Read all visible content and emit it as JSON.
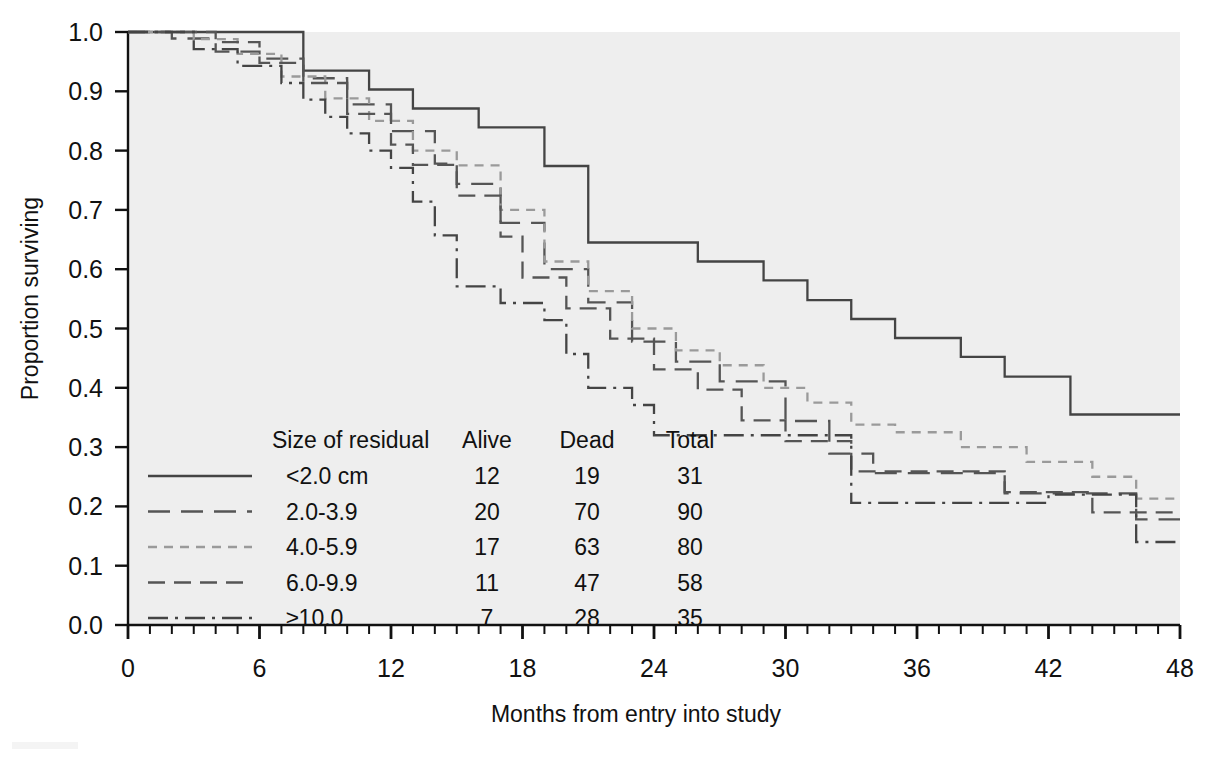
{
  "chart_data": {
    "type": "line",
    "subtype": "kaplan-meier-step",
    "title": "",
    "xlabel": "Months from entry into study",
    "ylabel": "Proportion surviving",
    "xlim": [
      0,
      48
    ],
    "ylim": [
      0.0,
      1.0
    ],
    "xticks": [
      0,
      6,
      12,
      18,
      24,
      30,
      36,
      42,
      48
    ],
    "xtick_labels": [
      "0",
      "6",
      "12",
      "18",
      "24",
      "30",
      "36",
      "42",
      "48"
    ],
    "x_minor_tick_interval": 1,
    "yticks": [
      0.0,
      0.1,
      0.2,
      0.3,
      0.4,
      0.5,
      0.6,
      0.7,
      0.8,
      0.9,
      1.0
    ],
    "ytick_labels": [
      "0.0",
      "0.1",
      "0.2",
      "0.3",
      "0.4",
      "0.5",
      "0.6",
      "0.7",
      "0.8",
      "0.9",
      "1.0"
    ],
    "grid": false,
    "legend_position": "lower-left-inside",
    "plot_background": "#eeeeee",
    "series": [
      {
        "name": "<2.0 cm",
        "linestyle": "solid",
        "color": "#444444",
        "x": [
          0,
          3,
          6,
          8,
          8,
          11,
          11,
          13,
          13,
          16,
          16,
          19,
          19,
          21,
          21,
          26,
          26,
          29,
          29,
          31,
          31,
          33,
          33,
          35,
          35,
          38,
          38,
          40,
          40,
          43,
          43,
          48
        ],
        "y": [
          1.0,
          1.0,
          1.0,
          1.0,
          0.935,
          0.935,
          0.903,
          0.903,
          0.871,
          0.871,
          0.839,
          0.839,
          0.774,
          0.774,
          0.645,
          0.645,
          0.613,
          0.613,
          0.581,
          0.581,
          0.548,
          0.548,
          0.516,
          0.516,
          0.484,
          0.484,
          0.452,
          0.452,
          0.419,
          0.419,
          0.355,
          0.355
        ]
      },
      {
        "name": "2.0-3.9",
        "linestyle": "long-dash",
        "color": "#555555",
        "x": [
          0,
          2,
          2,
          4,
          4,
          6,
          6,
          8,
          8,
          10,
          10,
          12,
          12,
          14,
          14,
          15,
          15,
          17,
          17,
          19,
          19,
          21,
          21,
          23,
          23,
          25,
          25,
          27,
          27,
          30,
          30,
          32,
          32,
          34,
          34,
          40,
          40,
          46,
          46,
          48
        ],
        "y": [
          1.0,
          1.0,
          0.989,
          0.989,
          0.967,
          0.967,
          0.955,
          0.955,
          0.922,
          0.922,
          0.878,
          0.878,
          0.833,
          0.833,
          0.778,
          0.778,
          0.744,
          0.744,
          0.678,
          0.678,
          0.6,
          0.6,
          0.544,
          0.544,
          0.478,
          0.478,
          0.444,
          0.444,
          0.411,
          0.411,
          0.344,
          0.344,
          0.289,
          0.289,
          0.256,
          0.256,
          0.222,
          0.222,
          0.178,
          0.178
        ]
      },
      {
        "name": "4.0-5.9",
        "linestyle": "short-dash",
        "color": "#9a9a9a",
        "x": [
          0,
          3,
          3,
          5,
          5,
          7,
          7,
          9,
          9,
          11,
          11,
          13,
          13,
          15,
          15,
          17,
          17,
          19,
          19,
          21,
          21,
          23,
          23,
          25,
          25,
          27,
          27,
          29,
          29,
          31,
          31,
          33,
          33,
          35,
          35,
          38,
          38,
          41,
          41,
          44,
          44,
          46,
          46,
          48
        ],
        "y": [
          1.0,
          1.0,
          0.988,
          0.988,
          0.963,
          0.963,
          0.925,
          0.925,
          0.888,
          0.888,
          0.85,
          0.85,
          0.8,
          0.8,
          0.775,
          0.775,
          0.7,
          0.7,
          0.613,
          0.613,
          0.563,
          0.563,
          0.5,
          0.5,
          0.463,
          0.463,
          0.438,
          0.438,
          0.4,
          0.4,
          0.375,
          0.375,
          0.338,
          0.338,
          0.325,
          0.325,
          0.3,
          0.3,
          0.275,
          0.275,
          0.25,
          0.25,
          0.213,
          0.213
        ]
      },
      {
        "name": "6.0-9.9",
        "linestyle": "dash-dash",
        "color": "#555555",
        "x": [
          0,
          4,
          4,
          6,
          6,
          8,
          8,
          10,
          10,
          12,
          12,
          13,
          13,
          15,
          15,
          17,
          17,
          18,
          18,
          20,
          20,
          22,
          22,
          24,
          24,
          26,
          26,
          28,
          28,
          30,
          30,
          33,
          33,
          40,
          40,
          44,
          44,
          48
        ],
        "y": [
          1.0,
          1.0,
          0.983,
          0.983,
          0.948,
          0.948,
          0.914,
          0.914,
          0.862,
          0.862,
          0.81,
          0.81,
          0.776,
          0.776,
          0.724,
          0.724,
          0.655,
          0.655,
          0.586,
          0.586,
          0.534,
          0.534,
          0.483,
          0.483,
          0.431,
          0.431,
          0.397,
          0.397,
          0.345,
          0.345,
          0.31,
          0.31,
          0.259,
          0.259,
          0.224,
          0.224,
          0.19,
          0.19
        ]
      },
      {
        "name": "≥10.0",
        "linestyle": "dash-dot",
        "color": "#444444",
        "x": [
          0,
          3,
          3,
          5,
          5,
          7,
          7,
          8,
          8,
          9,
          9,
          10,
          10,
          11,
          11,
          12,
          12,
          13,
          13,
          14,
          14,
          15,
          15,
          17,
          17,
          19,
          19,
          20,
          20,
          21,
          21,
          23,
          23,
          24,
          24,
          33,
          33,
          42,
          42,
          46,
          46,
          48
        ],
        "y": [
          1.0,
          1.0,
          0.971,
          0.971,
          0.943,
          0.943,
          0.914,
          0.914,
          0.886,
          0.886,
          0.857,
          0.857,
          0.829,
          0.829,
          0.8,
          0.8,
          0.771,
          0.771,
          0.714,
          0.714,
          0.657,
          0.657,
          0.571,
          0.571,
          0.543,
          0.543,
          0.514,
          0.514,
          0.457,
          0.457,
          0.4,
          0.4,
          0.371,
          0.371,
          0.32,
          0.32,
          0.206,
          0.206,
          0.22,
          0.22,
          0.14,
          0.14
        ]
      }
    ]
  },
  "legend": {
    "headers": [
      "Size of residual",
      "Alive",
      "Dead",
      "Total"
    ],
    "rows": [
      {
        "label": "<2.0 cm",
        "alive": "12",
        "dead": "19",
        "total": "31",
        "linestyle": "solid"
      },
      {
        "label": "2.0-3.9",
        "alive": "20",
        "dead": "70",
        "total": "90",
        "linestyle": "long-dash"
      },
      {
        "label": "4.0-5.9",
        "alive": "17",
        "dead": "63",
        "total": "80",
        "linestyle": "short-dash"
      },
      {
        "label": "6.0-9.9",
        "alive": "11",
        "dead": "47",
        "total": "58",
        "linestyle": "dash-dash"
      },
      {
        "label": "≥10.0",
        "alive": "7",
        "dead": "28",
        "total": "35",
        "linestyle": "dash-dot"
      }
    ]
  },
  "colors": {
    "plot_background": "#eeeeee",
    "axis": "#111111",
    "text": "#111111",
    "series_dark": "#444444",
    "series_light": "#9a9a9a"
  }
}
